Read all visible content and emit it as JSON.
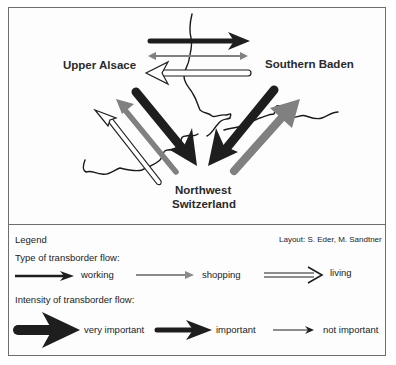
{
  "map": {
    "regions": {
      "upper_alsace": "Upper Alsace",
      "southern_baden": "Southern Baden",
      "northwest_switzerland_line1": "Northwest",
      "northwest_switzerland_line2": "Switzerland"
    },
    "flows": [
      {
        "from": "Upper Alsace",
        "to": "Southern Baden",
        "type": "working",
        "intensity": "important"
      },
      {
        "from": "Upper Alsace",
        "to": "Southern Baden",
        "type": "shopping",
        "intensity": "not important"
      },
      {
        "from": "Southern Baden",
        "to": "Upper Alsace",
        "type": "living",
        "intensity": "important"
      },
      {
        "from": "Upper Alsace",
        "to": "Northwest Switzerland",
        "type": "working",
        "intensity": "very important"
      },
      {
        "from": "Northwest Switzerland",
        "to": "Upper Alsace",
        "type": "shopping",
        "intensity": "important"
      },
      {
        "from": "Northwest Switzerland",
        "to": "Upper Alsace",
        "type": "living",
        "intensity": "important"
      },
      {
        "from": "Southern Baden",
        "to": "Northwest Switzerland",
        "type": "working",
        "intensity": "very important"
      },
      {
        "from": "Northwest Switzerland",
        "to": "Southern Baden",
        "type": "shopping",
        "intensity": "very important"
      }
    ]
  },
  "legend": {
    "title": "Legend",
    "credit": "Layout: S. Eder, M. Sandtner",
    "type_heading": "Type of transborder flow:",
    "types": [
      {
        "label": "working",
        "color": "#1e1e1e"
      },
      {
        "label": "shopping",
        "color": "#8a8a8a"
      },
      {
        "label": "living",
        "color": "#ffffff"
      }
    ],
    "intensity_heading": "Intensity of transborder flow:",
    "intensities": [
      {
        "label": "very important"
      },
      {
        "label": "important"
      },
      {
        "label": "not important"
      }
    ]
  },
  "colors": {
    "working": "#1e1e1e",
    "shopping": "#808080",
    "living_outline": "#1e1e1e",
    "frame": "#6e6e6e"
  }
}
